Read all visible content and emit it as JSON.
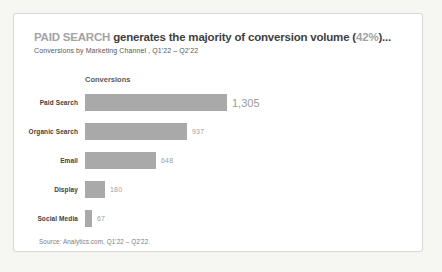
{
  "page": {
    "background_color": "#f6f6f3",
    "card_background": "#ffffff",
    "card_border_color": "#d8d8d4"
  },
  "header": {
    "title_prefix": "PAID SEARCH",
    "title_body": " generates the majority of conversion volume (",
    "title_highlight": "42%",
    "title_suffix": ")...",
    "subtitle": "Conversions by Marketing Channel , Q1'22 – Q2'22",
    "title_color": "#3f3f3f",
    "title_muted_color": "#a3a3a3"
  },
  "chart_data": {
    "type": "bar",
    "orientation": "horizontal",
    "axis_title": "Conversions",
    "categories": [
      "Paid Search",
      "Organic Search",
      "Email",
      "Display",
      "Social Media"
    ],
    "values": [
      1305,
      937,
      648,
      180,
      67
    ],
    "value_labels": [
      "1,305",
      "937",
      "648",
      "180",
      "67"
    ],
    "xlim": [
      0,
      1305
    ],
    "max_bar_px": 142,
    "bar_color": "#a9a9a9",
    "grid": false,
    "legend": "none",
    "value_label_position": "end-of-bar"
  },
  "footer": {
    "source": "Source: Analytics.com, Q1'22 – Q2'22."
  }
}
